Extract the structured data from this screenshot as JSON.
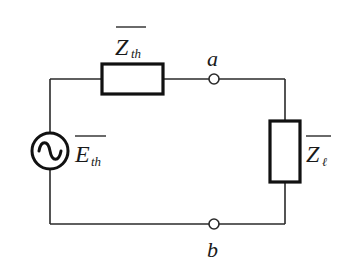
{
  "diagram": {
    "colors": {
      "wire": "#2a2a2a",
      "component": "#111111",
      "background": "#ffffff",
      "terminal_fill": "#ffffff"
    },
    "components": {
      "source": {
        "symbol": "ac-voltage-source",
        "label_main": "E",
        "label_sub": "th",
        "overline": true
      },
      "thevenin_impedance": {
        "symbol": "impedance-box",
        "label_main": "Z",
        "label_sub": "th",
        "overline": true
      },
      "load_impedance": {
        "symbol": "impedance-box",
        "label_main": "Z",
        "label_sub": "ℓ",
        "overline": true
      }
    },
    "terminals": {
      "top": {
        "label": "a"
      },
      "bottom": {
        "label": "b"
      }
    }
  }
}
